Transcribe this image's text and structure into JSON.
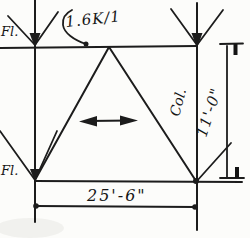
{
  "figure": {
    "kind": "hand-drawn structural frame sketch",
    "paper_color": "#fcfcfa",
    "ink_color": "#1c1c1c"
  },
  "labels": {
    "load": "1.6K/1",
    "floor_top": "Fl.",
    "floor_bottom": "Fl.",
    "column": "Col.",
    "height_dim": "11'-0\"",
    "span_dim": "25'-6\""
  },
  "annotations": {
    "load_arrows": "two downward load arrows at top corners",
    "sway_arrow": "double-headed horizontal arrow at frame center",
    "leader": "squiggle leader from load label to top chord"
  }
}
